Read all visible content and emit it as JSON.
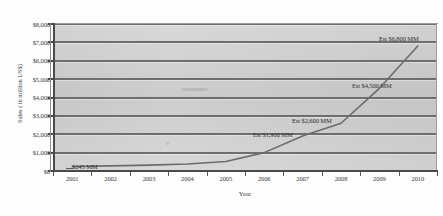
{
  "chart_data": {
    "type": "line",
    "title": "",
    "xlabel": "Year",
    "ylabel": "Sales ( in million US$)",
    "categories": [
      "2001",
      "2002",
      "2003",
      "2004",
      "2005",
      "2006",
      "2007",
      "2008",
      "2009",
      "2010"
    ],
    "values": [
      245,
      280,
      320,
      380,
      520,
      1000,
      1900,
      2600,
      4500,
      6800
    ],
    "ylim": [
      0,
      8000
    ],
    "ytick_labels": [
      "$8,000",
      "$7,000",
      "$6,000",
      "$5,000",
      "$4,000",
      "$3,000",
      "$2,000",
      "$1,000",
      "$0"
    ],
    "ytick_values": [
      8000,
      7000,
      6000,
      5000,
      4000,
      3000,
      2000,
      1000,
      0
    ],
    "grid": true,
    "legend": "none",
    "series_color": "#6b6b6b",
    "plot_background": "#d2d2d2",
    "gridline_color": "#6e6e6e",
    "axis_color": "#4a4a4a",
    "annotations": [
      {
        "id": "label-245",
        "text": "$245 MM",
        "category": "2001",
        "value": 245
      },
      {
        "id": "label-1900",
        "text": "Est $1,900 MM",
        "category": "2007",
        "value": 1900
      },
      {
        "id": "label-2600",
        "text": "Est $2,600 MM",
        "category": "2008",
        "value": 2600
      },
      {
        "id": "label-4500",
        "text": "Est $4,500 MM",
        "category": "2009",
        "value": 4500
      },
      {
        "id": "label-6800",
        "text": "Est $6,800 MM",
        "category": "2010",
        "value": 6800
      }
    ]
  }
}
